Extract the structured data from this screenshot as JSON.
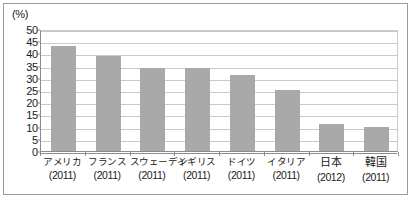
{
  "figure": {
    "unit_label": "(%)",
    "border_color": "#9a9a9a",
    "bar_color": "#a9a9a9",
    "grid_color": "#c9c9c9",
    "axis_color": "#8c8c8c"
  },
  "chart_data": {
    "type": "bar",
    "title": "",
    "xlabel": "",
    "ylabel": "(%)",
    "ylim": [
      0,
      50
    ],
    "yticks": [
      0,
      5,
      10,
      15,
      20,
      25,
      30,
      35,
      40,
      45,
      50
    ],
    "grid": true,
    "legend": "none",
    "categories": [
      "アメリカ",
      "フランス",
      "スウェーデン",
      "イギリス",
      "ドイツ",
      "イタリア",
      "日本",
      "韓国"
    ],
    "category_years": [
      "(2011)",
      "(2011)",
      "(2011)",
      "(2011)",
      "(2011)",
      "(2011)",
      "(2012)",
      "(2011)"
    ],
    "values": [
      43,
      39,
      34,
      34,
      31,
      25,
      11,
      10
    ]
  }
}
